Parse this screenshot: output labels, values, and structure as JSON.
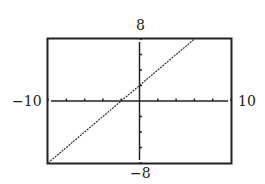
{
  "chart_data": {
    "type": "line",
    "title": "",
    "xlabel": "",
    "ylabel": "",
    "xlim": [
      -10,
      10
    ],
    "ylim": [
      -8,
      8
    ],
    "x_tick_step": 2,
    "y_tick_step": 2,
    "grid": false,
    "legend": null,
    "window_labels": {
      "ymax": "8",
      "ymin": "−8",
      "xmin": "−10",
      "xmax": "10"
    },
    "series": [
      {
        "name": "y = x + 2",
        "x": [
          -10,
          -2,
          0,
          6
        ],
        "y": [
          -8,
          0,
          2,
          8
        ]
      }
    ]
  }
}
